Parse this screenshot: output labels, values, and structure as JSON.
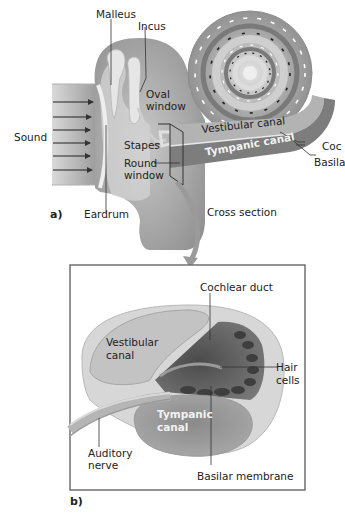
{
  "figure": {
    "panel_a": {
      "letter": "a)",
      "labels": {
        "malleus": "Malleus",
        "incus": "Incus",
        "oval_window": "Oval window",
        "oval_window_l1": "Oval",
        "oval_window_l2": "window",
        "sound": "Sound",
        "stapes": "Stapes",
        "round_window_l1": "Round",
        "round_window_l2": "window",
        "eardrum": "Eardrum",
        "vestibular_canal": "Vestibular canal",
        "tympanic_canal": "Tympanic canal",
        "cochlear_duct_truncated": "Coc",
        "basilar_membrane_truncated": "Basila",
        "cross_section": "Cross section"
      }
    },
    "panel_b": {
      "letter": "b)",
      "labels": {
        "cochlear_duct": "Cochlear duct",
        "vestibular_canal_l1": "Vestibular",
        "vestibular_canal_l2": "canal",
        "hair_cells_l1": "Hair",
        "hair_cells_l2": "cells",
        "tympanic_canal_l1": "Tympanic",
        "tympanic_canal_l2": "canal",
        "auditory_nerve_l1": "Auditory",
        "auditory_nerve_l2": "nerve",
        "basilar_membrane": "Basilar membrane"
      }
    },
    "colors": {
      "tissue_dark": "#8a8a8a",
      "tissue_mid": "#a9a9a9",
      "tissue_light": "#cfcfcf",
      "bone_light": "#e2e2e2",
      "hair_cells": "#4a4a4a",
      "line": "#333333",
      "frame": "#666666"
    }
  }
}
